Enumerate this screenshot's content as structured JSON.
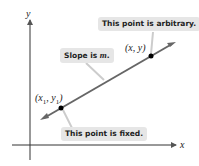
{
  "diagram": {
    "axes": {
      "x_label": "x",
      "y_label": "y"
    },
    "points": [
      {
        "id": "fixed",
        "label_x": "x",
        "label_sub": "1",
        "label_y": "y",
        "label_sub2": "1"
      },
      {
        "id": "arbitrary",
        "label": "(x, y)"
      }
    ],
    "callouts": {
      "arbitrary": "This point is arbitrary.",
      "slope_prefix": "Slope is ",
      "slope_var": "m",
      "slope_suffix": ".",
      "fixed": "This point is fixed."
    },
    "colors": {
      "line": "#666666",
      "callout_bg": "#e6e6e6",
      "point": "#000000"
    }
  }
}
